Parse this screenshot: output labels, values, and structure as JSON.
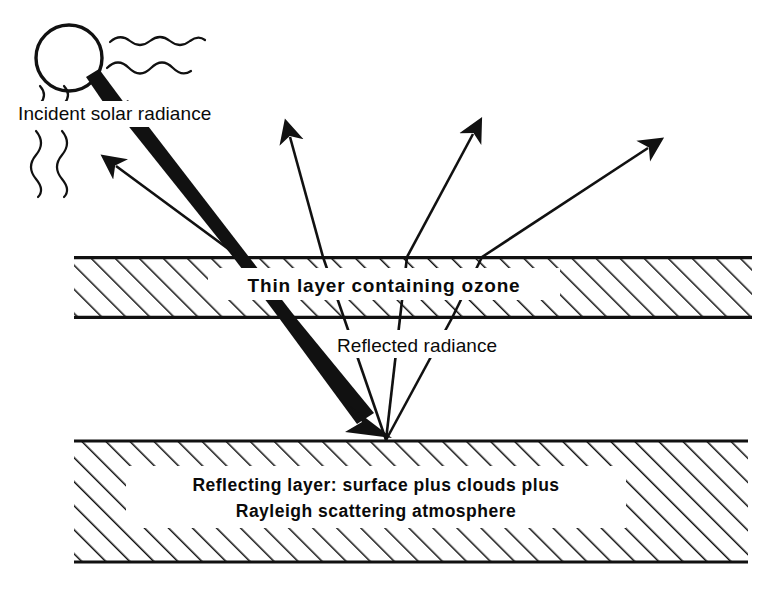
{
  "diagram": {
    "background_color": "#ffffff",
    "ink_color": "#111111",
    "labels": {
      "incident": "Incident solar radiance",
      "ozone_layer": "Thin layer containing ozone",
      "reflected": "Reflected radiance",
      "reflecting_layer_line1": "Reflecting layer:  surface plus clouds plus",
      "reflecting_layer_line2": "Rayleigh scattering atmosphere"
    },
    "layers": [
      {
        "id": "ozone-layer",
        "name": "Thin layer containing ozone",
        "x": 74,
        "y": 257,
        "width": 678,
        "height": 61,
        "hatch": "diagonal-up-right",
        "label": "Thin layer containing ozone"
      },
      {
        "id": "reflecting-layer",
        "name": "Reflecting layer",
        "x": 74,
        "y": 440,
        "width": 674,
        "height": 123,
        "hatch": "diagonal-up-right",
        "label": "Reflecting layer:  surface plus clouds plus Rayleigh scattering atmosphere"
      }
    ],
    "sun": {
      "name": "sun",
      "center_x": 69,
      "center_y": 58,
      "radius": 33,
      "wavy_ray_count": 4
    },
    "beams": [
      {
        "id": "incident-beam",
        "name": "incident solar beam",
        "kind": "thick-arrow",
        "from_x": 88,
        "from_y": 76,
        "to_x": 388,
        "to_y": 437,
        "direction": "down-right"
      },
      {
        "id": "upwelling-beam",
        "name": "upwelling thin arrow",
        "kind": "thin-arrow",
        "from_x": 240,
        "from_y": 256,
        "to_x": 110,
        "to_y": 160,
        "direction": "up-left"
      }
    ],
    "reflected_rays": [
      {
        "id": "ray-1",
        "surface_x": 386,
        "surface_y": 440,
        "tip_x": 287,
        "tip_y": 131,
        "label": "reflected ray 1"
      },
      {
        "id": "ray-2",
        "surface_x": 386,
        "surface_y": 440,
        "tip_x": 474,
        "tip_y": 128,
        "label": "reflected ray 2"
      },
      {
        "id": "ray-3",
        "surface_x": 386,
        "surface_y": 440,
        "tip_x": 654,
        "tip_y": 142,
        "label": "reflected ray 3"
      }
    ]
  }
}
